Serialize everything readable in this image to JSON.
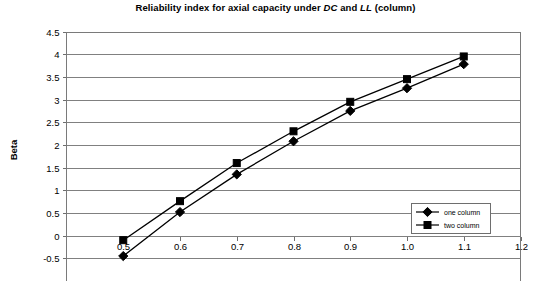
{
  "chart_data": {
    "type": "line",
    "title": "Reliability index for axial capacity under DC and LL (column)",
    "title_parts": {
      "before": "Reliability index for axial capacity under ",
      "italic_1": "DC",
      "middle": " and ",
      "italic_2": "LL",
      "after": " (column)"
    },
    "xlabel": "",
    "ylabel": "Beta",
    "x": [
      0.5,
      0.6,
      0.7,
      0.8,
      0.9,
      1.0,
      1.1
    ],
    "xlim": [
      0.4,
      1.2
    ],
    "ylim": [
      -1.0,
      4.5
    ],
    "xtick_labels": [
      "0.5",
      "0.6",
      "0.7",
      "0.8",
      "0.9",
      "1.0",
      "1.1",
      "1.2"
    ],
    "xtick_values": [
      0.5,
      0.6,
      0.7,
      0.8,
      0.9,
      1.0,
      1.1,
      1.2
    ],
    "ytick_labels": [
      "4.5",
      "4",
      "3.5",
      "3",
      "2.5",
      "2",
      "1.5",
      "1",
      "0.5",
      "0",
      "-0.5",
      "-1"
    ],
    "ytick_values": [
      4.5,
      4,
      3.5,
      3,
      2.5,
      2,
      1.5,
      1,
      0.5,
      0,
      -0.5,
      -1
    ],
    "grid": true,
    "grid_axis": "y",
    "legend_position": "inside-bottom-right",
    "series": [
      {
        "name": "one column",
        "marker": "diamond",
        "color": "#000000",
        "values": [
          -0.45,
          0.52,
          1.35,
          2.08,
          2.75,
          3.25,
          3.78
        ]
      },
      {
        "name": "two column",
        "marker": "square",
        "color": "#000000",
        "values": [
          -0.1,
          0.76,
          1.6,
          2.3,
          2.95,
          3.45,
          3.95
        ]
      }
    ]
  },
  "legend": {
    "items": [
      {
        "label": "one column"
      },
      {
        "label": "two column"
      }
    ]
  }
}
